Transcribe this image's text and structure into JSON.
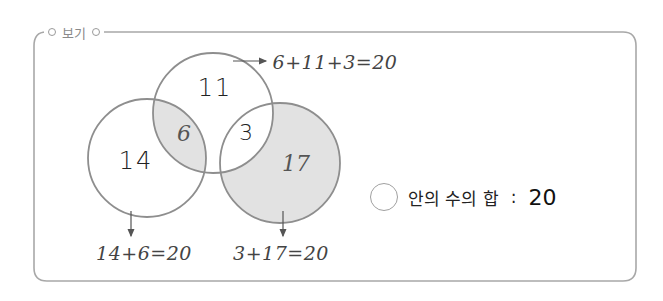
{
  "legend": {
    "label": "보기"
  },
  "colors": {
    "border": "#a8a8a8",
    "circle_stroke": "#8e8e8e",
    "shade": "#e2e2e2",
    "arrow": "#555555"
  },
  "venn": {
    "top_circle": {
      "value": "11"
    },
    "left_circle": {
      "value": "14"
    },
    "right_circle": {
      "value": "17"
    },
    "left_top_overlap": {
      "value": "6"
    },
    "top_right_overlap": {
      "value": "3"
    }
  },
  "equations": {
    "top": "6+11+3=20",
    "left": "14+6=20",
    "right": "3+17=20"
  },
  "note": {
    "label": "안의 수의 합",
    "colon": ":",
    "value": "20"
  }
}
